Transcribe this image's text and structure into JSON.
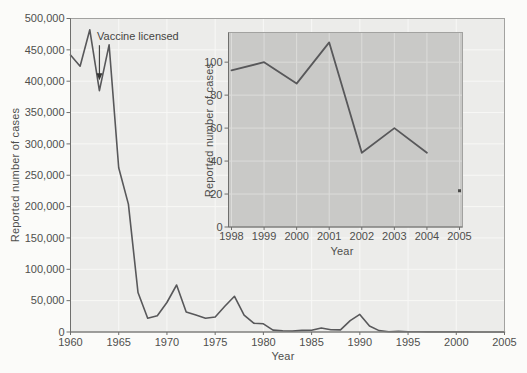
{
  "figure": {
    "colors": {
      "background": "#fbfbf9",
      "plot_bg": "#ececea",
      "inset_bg": "#c9c9c7",
      "grid_main": "#f8f8f6",
      "grid_inset": "#dcdcda",
      "border": "#a2a2a0",
      "axis": "#6f6f6d",
      "line": "#58585a",
      "text": "#4f4f4d"
    }
  },
  "chart_data": [
    {
      "type": "line",
      "id": "main",
      "title": "",
      "xlabel": "Year",
      "ylabel": "Reported number of cases",
      "xlim": [
        1960,
        2005
      ],
      "ylim": [
        0,
        500000
      ],
      "grid": true,
      "legend": "none",
      "xticks": [
        1960,
        1965,
        1970,
        1975,
        1980,
        1985,
        1990,
        1995,
        2000,
        2005
      ],
      "xtick_labels": [
        "1960",
        "1965",
        "1970",
        "1975",
        "1980",
        "1985",
        "1990",
        "1995",
        "2000",
        "2005"
      ],
      "yticks": [
        0,
        50000,
        100000,
        150000,
        200000,
        250000,
        300000,
        350000,
        400000,
        450000,
        500000
      ],
      "ytick_labels": [
        "0",
        "50,000",
        "100,000",
        "150,000",
        "200,000",
        "250,000",
        "300,000",
        "350,000",
        "400,000",
        "450,000",
        "500,000"
      ],
      "x": [
        1960,
        1961,
        1962,
        1963,
        1964,
        1965,
        1966,
        1967,
        1968,
        1969,
        1970,
        1971,
        1972,
        1973,
        1974,
        1975,
        1976,
        1977,
        1978,
        1979,
        1980,
        1981,
        1982,
        1983,
        1984,
        1985,
        1986,
        1987,
        1988,
        1989,
        1990,
        1991,
        1992,
        1993,
        1994,
        1995,
        1996,
        1997,
        1998,
        1999,
        2000,
        2001,
        2002,
        2003,
        2004,
        2005
      ],
      "values": [
        442000,
        424000,
        482000,
        385000,
        458000,
        262000,
        204000,
        63000,
        22000,
        26000,
        47000,
        75000,
        32000,
        27000,
        22000,
        24000,
        41000,
        57000,
        27000,
        14000,
        13000,
        3100,
        1700,
        1500,
        2600,
        2800,
        6300,
        3700,
        3400,
        18000,
        28000,
        9600,
        2200,
        300,
        1000,
        300,
        500,
        150,
        100,
        100,
        90,
        110,
        45,
        60,
        45,
        20
      ],
      "annotation": {
        "text": "Vaccine licensed",
        "x": 1963,
        "y": 400000
      }
    },
    {
      "type": "line",
      "id": "inset",
      "title": "",
      "xlabel": "Year",
      "ylabel": "Reported number of cases",
      "xlim": [
        1998,
        2005
      ],
      "ylim": [
        0,
        118
      ],
      "grid": true,
      "legend": "none",
      "xticks": [
        1998,
        1999,
        2000,
        2001,
        2002,
        2003,
        2004,
        2005
      ],
      "xtick_labels": [
        "1998",
        "1999",
        "2000",
        "2001",
        "2002",
        "2003",
        "2004",
        "2005"
      ],
      "yticks": [
        0,
        20,
        40,
        60,
        80,
        100
      ],
      "ytick_labels": [
        "0",
        "20",
        "40",
        "60",
        "80",
        "100"
      ],
      "x": [
        1998,
        1999,
        2000,
        2001,
        2002,
        2003,
        2004
      ],
      "values": [
        95,
        100,
        87,
        112,
        45,
        60,
        45
      ],
      "isolated_point": {
        "x": 2005,
        "y": 22
      }
    }
  ]
}
